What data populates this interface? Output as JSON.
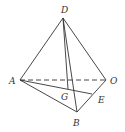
{
  "diagram": {
    "type": "tetrahedron",
    "vertices": {
      "D": {
        "x": 63,
        "y": 18,
        "label": "D",
        "lx": 61,
        "ly": 13
      },
      "A": {
        "x": 20,
        "y": 80,
        "label": "A",
        "lx": 9,
        "ly": 84
      },
      "O": {
        "x": 106,
        "y": 80,
        "label": "O",
        "lx": 110,
        "ly": 84
      },
      "B": {
        "x": 77,
        "y": 112,
        "label": "B",
        "lx": 73,
        "ly": 126
      },
      "E": {
        "x": 92,
        "y": 94,
        "label": "E",
        "lx": 98,
        "ly": 103
      },
      "G": {
        "x": 73,
        "y": 90,
        "label": "G",
        "lx": 61,
        "ly": 100
      },
      "F": {
        "x": 68,
        "y": 89
      }
    },
    "edges_solid": [
      [
        "D",
        "A"
      ],
      [
        "D",
        "O"
      ],
      [
        "D",
        "B"
      ],
      [
        "A",
        "B"
      ],
      [
        "B",
        "O"
      ],
      [
        "A",
        "E"
      ],
      [
        "D",
        "F"
      ]
    ],
    "edges_dashed": [
      [
        "A",
        "O"
      ]
    ],
    "line_color": "#333333"
  }
}
